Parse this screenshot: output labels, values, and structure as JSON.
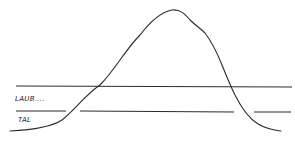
{
  "diagram": {
    "type": "hand-drawn mountain profile",
    "labels": {
      "upper_zone": "LAUB....",
      "lower_zone": "TAL"
    },
    "stroke_color": "#2a2a2a",
    "background": "#ffffff"
  }
}
